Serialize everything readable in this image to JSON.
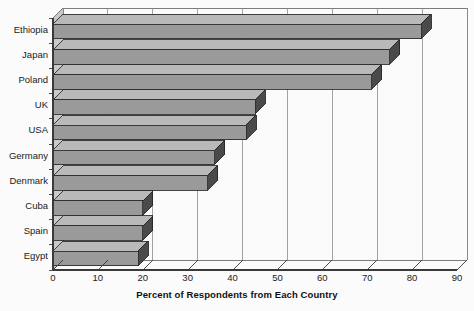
{
  "chart_data": {
    "type": "bar",
    "orientation": "horizontal",
    "title": "",
    "xlabel": "Percent of Respondents from Each Country",
    "ylabel": "",
    "categories": [
      "Ethiopia",
      "Japan",
      "Poland",
      "UK",
      "USA",
      "Germany",
      "Denmark",
      "Cuba",
      "Spain",
      "Egypt"
    ],
    "values": [
      82,
      75,
      71,
      45,
      43,
      36,
      34.5,
      20,
      20,
      19
    ],
    "xlim": [
      0,
      90
    ],
    "xticks": [
      0,
      10,
      20,
      30,
      40,
      50,
      60,
      70,
      80,
      90
    ],
    "xtick_labels": [
      "0",
      "10",
      "20",
      "30",
      "40",
      "50",
      "60",
      "70",
      "80",
      "90"
    ],
    "grid": true,
    "grid_axis": "x",
    "legend": false,
    "style": "3d",
    "bar_color": "#9a9a9a",
    "bar_top_color": "#b9b9b9",
    "bar_side_color": "#4a4a4a",
    "grid_color": "#8c8c8c",
    "axis_color": "#3a3a3a",
    "background": "#fbfbfb"
  },
  "axis": {
    "x_title": "Percent of Respondents from Each Country"
  }
}
